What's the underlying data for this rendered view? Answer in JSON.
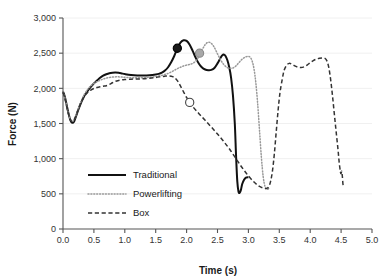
{
  "chart_data": {
    "type": "line",
    "title": "",
    "xlabel": "Time (s)",
    "ylabel": "Force (N)",
    "xlim": [
      0.0,
      5.0
    ],
    "ylim": [
      0,
      3000
    ],
    "xticks": [
      "0.0",
      "0.5",
      "1.0",
      "1.5",
      "2.0",
      "2.5",
      "3.0",
      "3.5",
      "4.0",
      "4.5",
      "5.0"
    ],
    "xtick_values": [
      0.0,
      0.5,
      1.0,
      1.5,
      2.0,
      2.5,
      3.0,
      3.5,
      4.0,
      4.5,
      5.0
    ],
    "yticks": [
      "0",
      "500",
      "1,000",
      "1,500",
      "2,000",
      "2,500",
      "3,000"
    ],
    "ytick_values": [
      0,
      500,
      1000,
      1500,
      2000,
      2500,
      3000
    ],
    "grid": true,
    "grid_axis": "y",
    "legend_position": "lower left",
    "series": [
      {
        "name": "Traditional",
        "style": "solid",
        "color": "#111111",
        "marker": {
          "x": 1.85,
          "y": 2570,
          "fill": "#1a1a1a",
          "edge": "#000000",
          "shape": "circle"
        },
        "points": [
          [
            0.0,
            1955
          ],
          [
            0.03,
            1880
          ],
          [
            0.06,
            1760
          ],
          [
            0.09,
            1640
          ],
          [
            0.12,
            1545
          ],
          [
            0.15,
            1510
          ],
          [
            0.18,
            1530
          ],
          [
            0.21,
            1600
          ],
          [
            0.25,
            1700
          ],
          [
            0.3,
            1810
          ],
          [
            0.35,
            1900
          ],
          [
            0.4,
            1965
          ],
          [
            0.45,
            2020
          ],
          [
            0.5,
            2070
          ],
          [
            0.55,
            2110
          ],
          [
            0.6,
            2150
          ],
          [
            0.65,
            2180
          ],
          [
            0.7,
            2200
          ],
          [
            0.75,
            2215
          ],
          [
            0.8,
            2222
          ],
          [
            0.85,
            2224
          ],
          [
            0.9,
            2220
          ],
          [
            0.95,
            2212
          ],
          [
            1.0,
            2203
          ],
          [
            1.1,
            2190
          ],
          [
            1.2,
            2183
          ],
          [
            1.3,
            2182
          ],
          [
            1.4,
            2186
          ],
          [
            1.5,
            2196
          ],
          [
            1.55,
            2205
          ],
          [
            1.6,
            2222
          ],
          [
            1.65,
            2252
          ],
          [
            1.7,
            2300
          ],
          [
            1.75,
            2370
          ],
          [
            1.8,
            2460
          ],
          [
            1.85,
            2565
          ],
          [
            1.9,
            2650
          ],
          [
            1.95,
            2683
          ],
          [
            2.0,
            2675
          ],
          [
            2.05,
            2620
          ],
          [
            2.1,
            2530
          ],
          [
            2.15,
            2430
          ],
          [
            2.2,
            2350
          ],
          [
            2.25,
            2295
          ],
          [
            2.3,
            2268
          ],
          [
            2.35,
            2258
          ],
          [
            2.4,
            2262
          ],
          [
            2.45,
            2290
          ],
          [
            2.5,
            2355
          ],
          [
            2.55,
            2435
          ],
          [
            2.58,
            2472
          ],
          [
            2.6,
            2480
          ],
          [
            2.63,
            2460
          ],
          [
            2.66,
            2400
          ],
          [
            2.69,
            2300
          ],
          [
            2.72,
            2150
          ],
          [
            2.75,
            1900
          ],
          [
            2.78,
            1500
          ],
          [
            2.8,
            1050
          ],
          [
            2.82,
            680
          ],
          [
            2.84,
            530
          ],
          [
            2.86,
            515
          ],
          [
            2.88,
            560
          ],
          [
            2.9,
            640
          ],
          [
            2.93,
            700
          ],
          [
            2.96,
            730
          ],
          [
            3.0,
            735
          ]
        ]
      },
      {
        "name": "Powerlifting",
        "style": "dotted",
        "color": "#999999",
        "marker": {
          "x": 2.21,
          "y": 2500,
          "fill": "#a8a8a8",
          "edge": "#8a8a8a",
          "shape": "circle"
        },
        "points": [
          [
            0.0,
            1950
          ],
          [
            0.03,
            1870
          ],
          [
            0.06,
            1750
          ],
          [
            0.09,
            1640
          ],
          [
            0.12,
            1560
          ],
          [
            0.15,
            1530
          ],
          [
            0.18,
            1555
          ],
          [
            0.22,
            1640
          ],
          [
            0.26,
            1740
          ],
          [
            0.3,
            1830
          ],
          [
            0.35,
            1920
          ],
          [
            0.4,
            1985
          ],
          [
            0.45,
            2035
          ],
          [
            0.5,
            2070
          ],
          [
            0.55,
            2095
          ],
          [
            0.6,
            2115
          ],
          [
            0.65,
            2132
          ],
          [
            0.7,
            2145
          ],
          [
            0.75,
            2155
          ],
          [
            0.8,
            2160
          ],
          [
            0.85,
            2163
          ],
          [
            0.9,
            2163
          ],
          [
            0.95,
            2160
          ],
          [
            1.0,
            2157
          ],
          [
            1.1,
            2152
          ],
          [
            1.2,
            2150
          ],
          [
            1.3,
            2152
          ],
          [
            1.4,
            2158
          ],
          [
            1.5,
            2168
          ],
          [
            1.6,
            2185
          ],
          [
            1.7,
            2212
          ],
          [
            1.75,
            2232
          ],
          [
            1.8,
            2255
          ],
          [
            1.85,
            2280
          ],
          [
            1.9,
            2300
          ],
          [
            1.95,
            2318
          ],
          [
            2.0,
            2330
          ],
          [
            2.05,
            2340
          ],
          [
            2.1,
            2355
          ],
          [
            2.15,
            2390
          ],
          [
            2.2,
            2455
          ],
          [
            2.25,
            2545
          ],
          [
            2.3,
            2620
          ],
          [
            2.35,
            2655
          ],
          [
            2.4,
            2640
          ],
          [
            2.45,
            2580
          ],
          [
            2.5,
            2490
          ],
          [
            2.55,
            2405
          ],
          [
            2.6,
            2340
          ],
          [
            2.65,
            2300
          ],
          [
            2.7,
            2285
          ],
          [
            2.75,
            2290
          ],
          [
            2.8,
            2320
          ],
          [
            2.85,
            2370
          ],
          [
            2.9,
            2415
          ],
          [
            2.95,
            2445
          ],
          [
            3.0,
            2455
          ],
          [
            3.03,
            2440
          ],
          [
            3.06,
            2390
          ],
          [
            3.09,
            2280
          ],
          [
            3.12,
            2080
          ],
          [
            3.15,
            1780
          ],
          [
            3.18,
            1400
          ],
          [
            3.21,
            1020
          ],
          [
            3.24,
            740
          ],
          [
            3.27,
            600
          ],
          [
            3.3,
            565
          ],
          [
            3.33,
            575
          ]
        ]
      },
      {
        "name": "Box",
        "style": "dashed",
        "color": "#333333",
        "marker": {
          "x": 2.05,
          "y": 1800,
          "fill": "#ffffff",
          "edge": "#444444",
          "shape": "circle"
        },
        "points": [
          [
            0.0,
            1945
          ],
          [
            0.03,
            1865
          ],
          [
            0.06,
            1745
          ],
          [
            0.09,
            1635
          ],
          [
            0.12,
            1555
          ],
          [
            0.15,
            1525
          ],
          [
            0.18,
            1550
          ],
          [
            0.22,
            1635
          ],
          [
            0.26,
            1730
          ],
          [
            0.3,
            1815
          ],
          [
            0.35,
            1890
          ],
          [
            0.4,
            1940
          ],
          [
            0.45,
            1975
          ],
          [
            0.5,
            1998
          ],
          [
            0.55,
            2012
          ],
          [
            0.6,
            2022
          ],
          [
            0.65,
            2030
          ],
          [
            0.7,
            2038
          ],
          [
            0.75,
            2055
          ],
          [
            0.8,
            2080
          ],
          [
            0.85,
            2100
          ],
          [
            0.9,
            2112
          ],
          [
            0.95,
            2120
          ],
          [
            1.0,
            2125
          ],
          [
            1.1,
            2130
          ],
          [
            1.2,
            2133
          ],
          [
            1.3,
            2137
          ],
          [
            1.4,
            2145
          ],
          [
            1.5,
            2155
          ],
          [
            1.6,
            2168
          ],
          [
            1.65,
            2173
          ],
          [
            1.7,
            2176
          ],
          [
            1.75,
            2172
          ],
          [
            1.8,
            2155
          ],
          [
            1.85,
            2110
          ],
          [
            1.9,
            2035
          ],
          [
            1.95,
            1950
          ],
          [
            2.0,
            1870
          ],
          [
            2.05,
            1800
          ],
          [
            2.1,
            1740
          ],
          [
            2.2,
            1640
          ],
          [
            2.3,
            1545
          ],
          [
            2.4,
            1450
          ],
          [
            2.5,
            1350
          ],
          [
            2.6,
            1245
          ],
          [
            2.7,
            1130
          ],
          [
            2.8,
            1000
          ],
          [
            2.9,
            870
          ],
          [
            3.0,
            755
          ],
          [
            3.1,
            660
          ],
          [
            3.18,
            605
          ],
          [
            3.25,
            580
          ],
          [
            3.3,
            580
          ],
          [
            3.33,
            600
          ],
          [
            3.36,
            680
          ],
          [
            3.39,
            830
          ],
          [
            3.42,
            1070
          ],
          [
            3.45,
            1380
          ],
          [
            3.48,
            1680
          ],
          [
            3.51,
            1930
          ],
          [
            3.55,
            2140
          ],
          [
            3.58,
            2260
          ],
          [
            3.62,
            2330
          ],
          [
            3.66,
            2355
          ],
          [
            3.7,
            2345
          ],
          [
            3.75,
            2320
          ],
          [
            3.8,
            2300
          ],
          [
            3.85,
            2295
          ],
          [
            3.9,
            2305
          ],
          [
            3.95,
            2330
          ],
          [
            4.0,
            2365
          ],
          [
            4.05,
            2395
          ],
          [
            4.1,
            2415
          ],
          [
            4.15,
            2428
          ],
          [
            4.2,
            2432
          ],
          [
            4.24,
            2425
          ],
          [
            4.27,
            2390
          ],
          [
            4.3,
            2300
          ],
          [
            4.33,
            2130
          ],
          [
            4.36,
            1900
          ],
          [
            4.39,
            1640
          ],
          [
            4.42,
            1380
          ],
          [
            4.45,
            1130
          ],
          [
            4.47,
            940
          ],
          [
            4.49,
            810
          ],
          [
            4.5,
            790
          ],
          [
            4.51,
            820
          ],
          [
            4.52,
            750
          ],
          [
            4.53,
            640
          ],
          [
            4.54,
            600
          ]
        ]
      }
    ],
    "legend": [
      {
        "label": "Traditional",
        "style": "solid"
      },
      {
        "label": "Powerlifting",
        "style": "dotted"
      },
      {
        "label": "Box",
        "style": "dashed"
      }
    ]
  }
}
